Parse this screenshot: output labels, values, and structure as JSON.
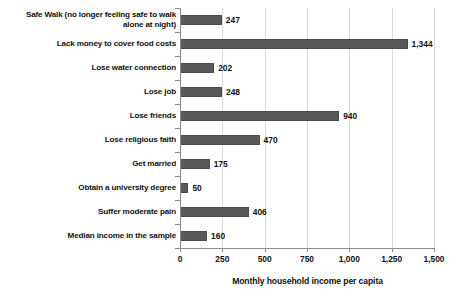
{
  "chart_data": {
    "type": "bar",
    "orientation": "horizontal",
    "title": "",
    "xlabel": "Monthly household income per capita",
    "ylabel": "",
    "xlim": [
      0,
      1500
    ],
    "xticks": [
      0,
      250,
      500,
      750,
      1000,
      1250,
      1500
    ],
    "xtick_labels": [
      "0",
      "250",
      "500",
      "750",
      "1,000",
      "1,250",
      "1,500"
    ],
    "grid": true,
    "legend": false,
    "bar_color": "#595959",
    "categories": [
      "Safe Walk (no longer feeling safe to walk alone at night)",
      "Lack money to cover food costs",
      "Lose water connection",
      "Lose job",
      "Lose friends",
      "Lose religious faith",
      "Get married",
      "Obtain a university degree",
      "Suffer moderate pain",
      "Median income in the sample"
    ],
    "category_lines": [
      [
        "Safe Walk (no longer feeling safe to walk",
        "alone at night)"
      ],
      [
        "Lack money to cover food costs"
      ],
      [
        "Lose water connection"
      ],
      [
        "Lose job"
      ],
      [
        "Lose friends"
      ],
      [
        "Lose religious faith"
      ],
      [
        "Get married"
      ],
      [
        "Obtain a university degree"
      ],
      [
        "Suffer moderate pain"
      ],
      [
        "Median income in the sample"
      ]
    ],
    "values": [
      247,
      1344,
      202,
      248,
      940,
      470,
      175,
      50,
      406,
      160
    ],
    "value_labels": [
      "247",
      "1,344",
      "202",
      "248",
      "940",
      "470",
      "175",
      "50",
      "406",
      "160"
    ]
  }
}
